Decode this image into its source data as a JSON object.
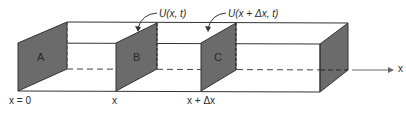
{
  "diagram": {
    "type": "3d-bar-cross-sections",
    "colors": {
      "panel_fill": "#6b6b6b",
      "line": "#333333",
      "dashed": "#444444",
      "arrow": "#666666",
      "background": "#ffffff"
    },
    "panels": [
      {
        "id": "A",
        "label": "A"
      },
      {
        "id": "B",
        "label": "B"
      },
      {
        "id": "C",
        "label": "C"
      }
    ],
    "annotations": {
      "u_at_x": "U(x, t)",
      "u_at_x_dx": "U(x + Δx, t)"
    },
    "axis": {
      "label": "x"
    },
    "positions": {
      "origin": "x = 0",
      "x": "x",
      "x_plus_dx": "x + Δx"
    }
  }
}
